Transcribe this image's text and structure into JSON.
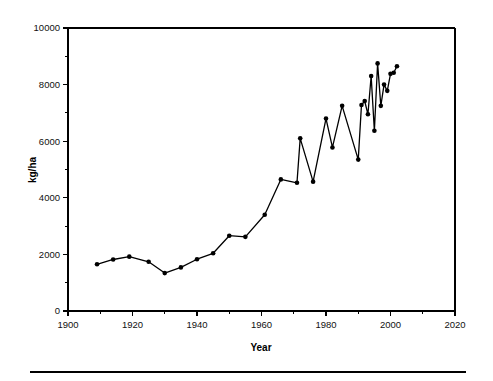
{
  "chart_data": {
    "type": "line",
    "title": "",
    "subtitle": "",
    "xlabel": "Year",
    "ylabel": "kg/ha",
    "xlim": [
      1900,
      2020
    ],
    "ylim": [
      0,
      10000
    ],
    "xticks": [
      1900,
      1920,
      1940,
      1960,
      1980,
      2000,
      2020
    ],
    "xticks_minor": [
      1910,
      1930,
      1950,
      1970,
      1990,
      2010
    ],
    "yticks": [
      0,
      2000,
      4000,
      6000,
      8000,
      10000
    ],
    "yticks_minor": [
      1000,
      3000,
      5000,
      7000,
      9000
    ],
    "grid": false,
    "legend": null,
    "marker": "filled-circle",
    "line_color": "#000000",
    "marker_color": "#000000",
    "series": [
      {
        "name": "Yield",
        "x": [
          1909,
          1914,
          1919,
          1925,
          1930,
          1935,
          1940,
          1945,
          1950,
          1955,
          1961,
          1966,
          1971,
          1972,
          1976,
          1980,
          1982,
          1985,
          1990,
          1991,
          1992,
          1993,
          1994,
          1995,
          1996,
          1997,
          1998,
          1999,
          2000,
          2001,
          2002
        ],
        "y": [
          1650,
          1820,
          1920,
          1740,
          1340,
          1540,
          1830,
          2040,
          2660,
          2620,
          3400,
          4650,
          4530,
          6100,
          4570,
          6800,
          5780,
          7250,
          5350,
          7280,
          7420,
          6950,
          8300,
          6370,
          8750,
          7250,
          8000,
          7780,
          8380,
          8420,
          8650
        ]
      }
    ]
  },
  "axis": {
    "y_tick_labels": [
      "0",
      "2000",
      "4000",
      "6000",
      "8000",
      "10000"
    ],
    "x_tick_labels": [
      "1900",
      "1920",
      "1940",
      "1960",
      "1980",
      "2000",
      "2020"
    ],
    "y_axis_title": "kg/ha",
    "x_axis_title": "Year"
  }
}
